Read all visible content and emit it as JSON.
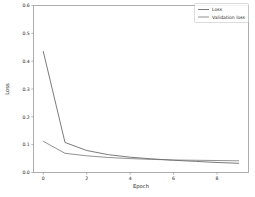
{
  "chart_data": {
    "type": "line",
    "title": "",
    "xlabel": "Epoch",
    "ylabel": "Loss",
    "xlim": [
      -0.45,
      9.45
    ],
    "ylim": [
      0.0,
      0.6
    ],
    "grid": false,
    "legend_position": "upper right",
    "x": [
      0,
      1,
      2,
      3,
      4,
      5,
      6,
      7,
      8,
      9
    ],
    "xticks": [
      0,
      2,
      4,
      6,
      8
    ],
    "xtick_labels": [
      "0",
      "2",
      "4",
      "6",
      "8"
    ],
    "yticks": [
      0.0,
      0.1,
      0.2,
      0.3,
      0.4,
      0.5,
      0.6
    ],
    "ytick_labels": [
      "0.0",
      "0.1",
      "0.2",
      "0.3",
      "0.4",
      "0.5",
      "0.6"
    ],
    "series": [
      {
        "name": "Loss",
        "color": "#4f4f4f",
        "values": [
          0.435,
          0.108,
          0.079,
          0.064,
          0.055,
          0.049,
          0.044,
          0.04,
          0.036,
          0.033
        ]
      },
      {
        "name": "Validation loss",
        "color": "#6e6e6e",
        "values": [
          0.112,
          0.069,
          0.06,
          0.054,
          0.05,
          0.047,
          0.045,
          0.044,
          0.043,
          0.042
        ]
      }
    ]
  },
  "legend": {
    "entries": [
      {
        "label": "Loss"
      },
      {
        "label": "Validation loss"
      }
    ]
  },
  "axes": {
    "x_axis_title": "Epoch",
    "y_axis_title": "Loss"
  }
}
